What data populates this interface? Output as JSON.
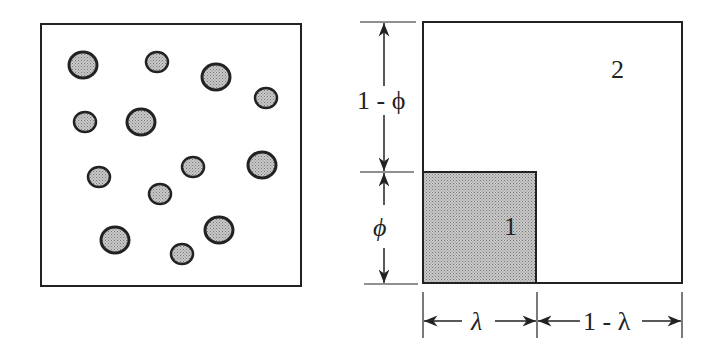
{
  "figure": {
    "left_panel": {
      "description": "random dispersion of particles in matrix",
      "particles": [
        {
          "cx": 83,
          "cy": 65,
          "r": 13
        },
        {
          "cx": 157,
          "cy": 62,
          "r": 10
        },
        {
          "cx": 216,
          "cy": 77,
          "r": 13
        },
        {
          "cx": 266,
          "cy": 98,
          "r": 10
        },
        {
          "cx": 85,
          "cy": 122,
          "r": 10
        },
        {
          "cx": 141,
          "cy": 122,
          "r": 13
        },
        {
          "cx": 99,
          "cy": 177,
          "r": 10
        },
        {
          "cx": 193,
          "cy": 167,
          "r": 10
        },
        {
          "cx": 262,
          "cy": 165,
          "r": 13
        },
        {
          "cx": 160,
          "cy": 194,
          "r": 10
        },
        {
          "cx": 115,
          "cy": 240,
          "r": 13
        },
        {
          "cx": 219,
          "cy": 230,
          "r": 13
        },
        {
          "cx": 182,
          "cy": 254,
          "r": 10
        }
      ]
    },
    "right_panel": {
      "region_1_label": "1",
      "region_2_label": "2",
      "dim_top": "1 - ϕ",
      "dim_bottom": "ϕ",
      "dim_lambda": "λ",
      "dim_one_minus_lambda": "1 - λ"
    },
    "colors": {
      "stroke": "#222222",
      "fill_particle": "#b4b4b4",
      "background": "#ffffff"
    }
  }
}
